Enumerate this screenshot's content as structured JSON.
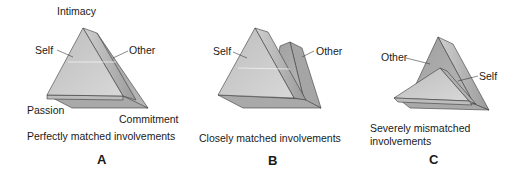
{
  "panels": [
    {
      "id": "A",
      "letter": "A",
      "caption": "Perfectly matched involvements",
      "labels": {
        "intimacy": "Intimacy",
        "self": "Self",
        "other": "Other",
        "passion": "Passion",
        "commitment": "Commitment"
      }
    },
    {
      "id": "B",
      "letter": "B",
      "caption": "Closely matched involvements",
      "labels": {
        "self": "Self",
        "other": "Other"
      }
    },
    {
      "id": "C",
      "letter": "C",
      "caption_line1": "Severely mismatched",
      "caption_line2": "involvements",
      "labels": {
        "other": "Other",
        "self": "Self"
      }
    }
  ],
  "colors": {
    "face_light": "#c9c9c9",
    "face_mid": "#a8a8a8",
    "face_dark": "#8c8c8c",
    "edge": "#3a3a3a",
    "text": "#1a1a1a"
  }
}
